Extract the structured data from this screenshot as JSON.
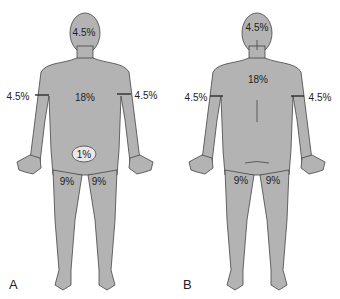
{
  "colors": {
    "body": "#b3b3b3",
    "outline": "#444444",
    "text": "#222222"
  },
  "figures": [
    {
      "panel": "A",
      "view": "anterior",
      "labels": {
        "head": "4.5%",
        "trunk": "18%",
        "right_arm": "4.5%",
        "left_arm": "4.5%",
        "genitalia": "1%",
        "right_leg": "9%",
        "left_leg": "9%"
      }
    },
    {
      "panel": "B",
      "view": "posterior",
      "labels": {
        "head": "4.5%",
        "trunk": "18%",
        "right_arm": "4.5%",
        "left_arm": "4.5%",
        "right_leg": "9%",
        "left_leg": "9%"
      }
    }
  ]
}
